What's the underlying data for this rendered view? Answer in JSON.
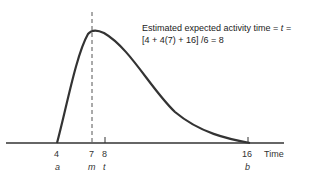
{
  "annotation": {
    "line1_prefix": "Estimated expected activity time",
    "line1_eq": "=",
    "line1_var": "t",
    "line1_suffix": "=",
    "line2": "[4 + 4(7) + 16] /6 = 8"
  },
  "axis": {
    "label": "Time",
    "ticks": [
      {
        "value": "4",
        "symbol": "a"
      },
      {
        "value": "7",
        "symbol": "m"
      },
      {
        "value": "8",
        "symbol": "t"
      },
      {
        "value": "16",
        "symbol": "b"
      }
    ]
  },
  "colors": {
    "curve": "#333333",
    "axis": "#333333",
    "dashed": "#555555"
  }
}
